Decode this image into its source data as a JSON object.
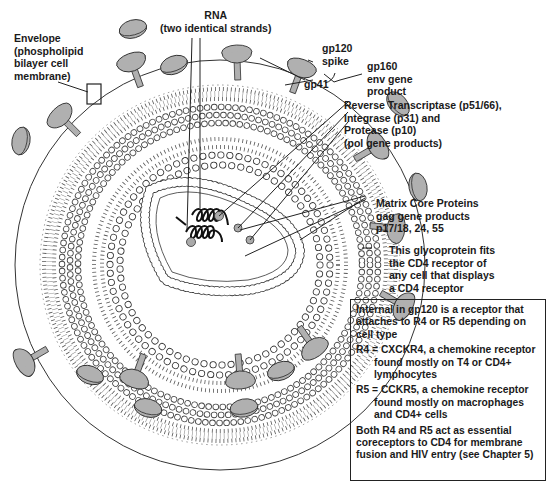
{
  "diagram": {
    "colors": {
      "outline": "#333333",
      "protein_fill": "#b0b0b0",
      "background": "#ffffff",
      "text": "#1a1a1a"
    },
    "labels": {
      "envelope": [
        "Envelope",
        "(phospholipid",
        "bilayer cell",
        "membrane)"
      ],
      "rna": [
        "RNA",
        "(two identical strands)"
      ],
      "gp120": [
        "gp120",
        "spike"
      ],
      "gp41": [
        "gp41"
      ],
      "gp160": [
        "gp160",
        "env gene",
        "product"
      ],
      "pol": [
        "Reverse Transcriptase (p51/66),",
        "Integrase (p31) and",
        "Protease (p10)",
        "(pol gene products)"
      ],
      "gag": [
        "Matrix Core Proteins",
        "gag gene products",
        "p17/18, 24, 55"
      ],
      "glycoprotein": [
        "This glycoprotein fits",
        "the CD4 receptor of",
        "any cell that displays",
        "a CD4 receptor"
      ]
    },
    "infobox": {
      "intro": "Internal in gp120 is a receptor that attaches to R4 or R5 depending on cell type",
      "r4": "R4 = CXCKR4, a chemokine receptor found mostly on T4 or CD4+ lymphocytes",
      "r5": "R5 = CCKR5, a chemokine receptor found mostly on macrophages and CD4+ cells",
      "conclusion": "Both R4 and R5 act as essential coreceptors to CD4 for membrane fusion and HIV entry (see Chapter 5)"
    }
  }
}
